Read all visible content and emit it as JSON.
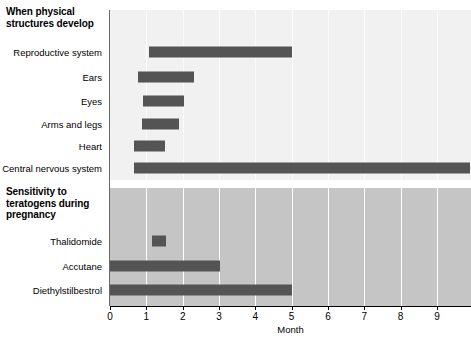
{
  "chart_data": {
    "type": "bar",
    "orientation": "horizontal",
    "title": "",
    "xlabel": "Month",
    "ylabel": "",
    "xlim": [
      0,
      9.9
    ],
    "grid": true,
    "legend": "none",
    "xticks": [
      "0",
      "1",
      "2",
      "3",
      "4",
      "5",
      "6",
      "7",
      "8",
      "9"
    ],
    "xtick_values": [
      0,
      1,
      2,
      3,
      4,
      5,
      6,
      7,
      8,
      9
    ],
    "colors": {
      "bar": "#545454",
      "panel_top_bg": "#f1f1f1",
      "panel_bottom_bg": "#c5c5c5",
      "gridline": "#ffffff",
      "axis": "#000000",
      "text": "#000000"
    },
    "panels": [
      {
        "id": "physical-structures",
        "title": "When physical structures develop",
        "title_lines": [
          "When physical",
          "structures develop"
        ],
        "background": "#f1f1f1",
        "categories": [
          "Reproductive system",
          "Ears",
          "Eyes",
          "Arms and legs",
          "Heart",
          "Central nervous system"
        ],
        "bars": [
          {
            "label": "Reproductive system",
            "start": 1.07,
            "end": 5.01
          },
          {
            "label": "Ears",
            "start": 0.77,
            "end": 2.32
          },
          {
            "label": "Eyes",
            "start": 0.91,
            "end": 2.03
          },
          {
            "label": "Arms and legs",
            "start": 0.88,
            "end": 1.9
          },
          {
            "label": "Heart",
            "start": 0.66,
            "end": 1.52
          },
          {
            "label": "Central nervous system",
            "start": 0.66,
            "end": 9.9
          }
        ]
      },
      {
        "id": "teratogen-sensitivity",
        "title": "Sensitivity to teratogens during pregnancy",
        "title_lines": [
          "Sensitivity to",
          "teratogens during",
          "pregnancy"
        ],
        "background": "#c5c5c5",
        "categories": [
          "Thalidomide",
          "Accutane",
          "Diethylstilbestrol"
        ],
        "bars": [
          {
            "label": "Thalidomide",
            "start": 1.16,
            "end": 1.54
          },
          {
            "label": "Accutane",
            "start": 0.0,
            "end": 3.03
          },
          {
            "label": "Diethylstilbestrol",
            "start": 0.0,
            "end": 5.01
          }
        ]
      }
    ]
  }
}
